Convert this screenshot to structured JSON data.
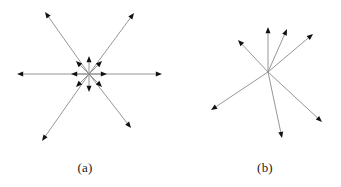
{
  "figure": {
    "name": "two-panel-vector-star-diagram",
    "width": 341,
    "height": 187,
    "background_color": "#ffffff",
    "line_color": "#8a8a8a",
    "arrowhead_color": "#111111",
    "caption_color": "#1b1b1b",
    "line_width": 0.9
  },
  "panels": [
    {
      "id": "a",
      "caption": "(a)",
      "caption_x": 85,
      "caption_y": 172,
      "center_x": 89,
      "center_y": 74,
      "description": "radial star of long and short arrows about a common origin",
      "long_vectors": [
        {
          "name": "long-arrow-right",
          "tip_x": 162,
          "tip_y": 74
        },
        {
          "name": "long-arrow-left",
          "tip_x": 17,
          "tip_y": 74
        },
        {
          "name": "long-arrow-upper-left",
          "tip_x": 45,
          "tip_y": 12
        },
        {
          "name": "long-arrow-upper-right",
          "tip_x": 134,
          "tip_y": 13
        },
        {
          "name": "long-arrow-lower-left",
          "tip_x": 42,
          "tip_y": 141
        },
        {
          "name": "long-arrow-lower-right",
          "tip_x": 131,
          "tip_y": 128
        }
      ],
      "short_vectors": [
        {
          "name": "short-arrow-right",
          "tip_x": 107,
          "tip_y": 74
        },
        {
          "name": "short-arrow-upper-right",
          "tip_x": 102,
          "tip_y": 61
        },
        {
          "name": "short-arrow-up",
          "tip_x": 89,
          "tip_y": 56
        },
        {
          "name": "short-arrow-upper-left",
          "tip_x": 76,
          "tip_y": 61
        },
        {
          "name": "short-arrow-left",
          "tip_x": 71,
          "tip_y": 74
        },
        {
          "name": "short-arrow-lower-left",
          "tip_x": 76,
          "tip_y": 87
        },
        {
          "name": "short-arrow-down",
          "tip_x": 89,
          "tip_y": 92
        },
        {
          "name": "short-arrow-lower-right",
          "tip_x": 102,
          "tip_y": 87
        }
      ]
    },
    {
      "id": "b",
      "caption": "(b)",
      "caption_x": 265,
      "caption_y": 172,
      "center_x": 268,
      "center_y": 72,
      "description": "fan of seven arrows of unequal length about a common origin",
      "long_vectors": [
        {
          "name": "arrow-upper-left",
          "tip_x": 238,
          "tip_y": 40
        },
        {
          "name": "arrow-up",
          "tip_x": 268,
          "tip_y": 27
        },
        {
          "name": "arrow-upper-right-steep",
          "tip_x": 287,
          "tip_y": 29
        },
        {
          "name": "arrow-upper-right-shallow",
          "tip_x": 313,
          "tip_y": 34
        },
        {
          "name": "arrow-lower-left",
          "tip_x": 211,
          "tip_y": 110
        },
        {
          "name": "arrow-down",
          "tip_x": 282,
          "tip_y": 138
        },
        {
          "name": "arrow-lower-right",
          "tip_x": 322,
          "tip_y": 122
        }
      ],
      "short_vectors": []
    }
  ]
}
